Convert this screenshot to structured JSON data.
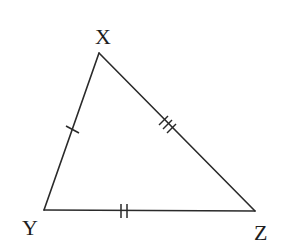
{
  "diagram": {
    "type": "triangle",
    "colors": {
      "stroke": "#2a2a2a",
      "label": "#1e1e1e",
      "background": "#ffffff"
    },
    "vertices": [
      {
        "id": "X",
        "label": "X",
        "x": 99,
        "y": 53,
        "label_x": 104,
        "label_y": 44
      },
      {
        "id": "Y",
        "label": "Y",
        "x": 44,
        "y": 210,
        "label_x": 31,
        "label_y": 235
      },
      {
        "id": "Z",
        "label": "Z",
        "x": 255,
        "y": 211,
        "label_x": 262,
        "label_y": 240
      }
    ],
    "sides": [
      {
        "id": "XY",
        "from": "X",
        "to": "Y",
        "tick_marks": 1
      },
      {
        "id": "XZ",
        "from": "X",
        "to": "Z",
        "tick_marks": 3
      },
      {
        "id": "YZ",
        "from": "Y",
        "to": "Z",
        "tick_marks": 2
      }
    ]
  }
}
